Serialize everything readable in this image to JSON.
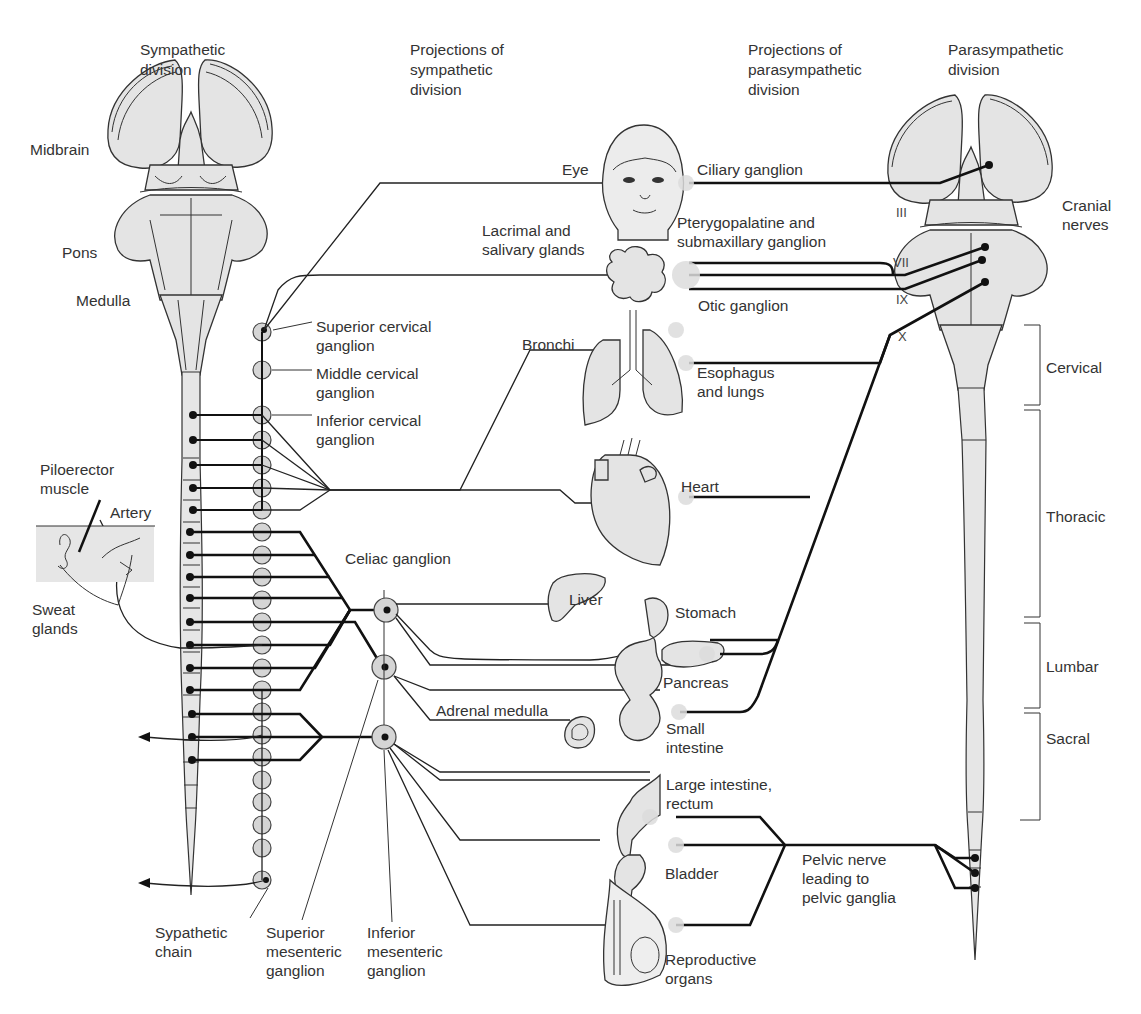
{
  "headers": {
    "sympathetic_division": "Sympathetic\ndivision",
    "projections_sympathetic": "Projections of\nsympathetic\ndivision",
    "projections_parasympathetic": "Projections of\nparasympathetic\ndivision",
    "parasympathetic_division": "Parasympathetic\ndivision"
  },
  "brainstem_labels": {
    "midbrain": "Midbrain",
    "pons": "Pons",
    "medulla": "Medulla"
  },
  "sympathetic_labels": {
    "superior_cervical": "Superior cervical\nganglion",
    "middle_cervical": "Middle cervical\nganglion",
    "inferior_cervical": "Inferior cervical\nganglion",
    "piloerector": "Piloerector\nmuscle",
    "artery": "Artery",
    "sweat_glands": "Sweat\nglands",
    "celiac": "Celiac ganglion",
    "chain": "Sypathetic\nchain",
    "superior_mesenteric": "Superior\nmesenteric\nganglion",
    "inferior_mesenteric": "Inferior\nmesenteric\nganglion"
  },
  "organs": {
    "eye": "Eye",
    "lacrimal": "Lacrimal and\nsalivary glands",
    "bronchi": "Bronchi",
    "esophagus": "Esophagus\nand lungs",
    "heart": "Heart",
    "liver": "Liver",
    "stomach": "Stomach",
    "pancreas": "Pancreas",
    "adrenal": "Adrenal medulla",
    "small_intestine": "Small\nintestine",
    "large_intestine": "Large intestine,\nrectum",
    "bladder": "Bladder",
    "reproductive": "Reproductive\norgans"
  },
  "parasympathetic_labels": {
    "ciliary": "Ciliary ganglion",
    "pterygopalatine": "Pterygopalatine and\nsubmaxillary ganglion",
    "otic": "Otic ganglion",
    "pelvic": "Pelvic nerve\nleading to\npelvic ganglia",
    "cranial_nerves": "Cranial\nnerves"
  },
  "cranial_nerve_numbers": {
    "iii": "III",
    "vii": "VII",
    "ix": "IX",
    "x": "X"
  },
  "spinal_regions": {
    "cervical": "Cervical",
    "thoracic": "Thoracic",
    "lumbar": "Lumbar",
    "sacral": "Sacral"
  },
  "colors": {
    "tissue_fill": "#e4e4e4",
    "line": "#111111",
    "background": "#ffffff"
  }
}
